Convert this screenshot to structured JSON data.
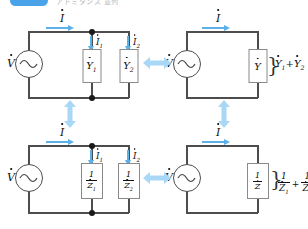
{
  "header": {
    "badge_color": "#4aa3e8",
    "faint_text": "アドミタンス 並列"
  },
  "colors": {
    "wire": "#4d4d4d",
    "arrow_blue": "#5bb0e8",
    "equiv_arrow": "#a8d8f5",
    "node": "#1a1a1a"
  },
  "panels": {
    "top_left": {
      "source_label": "V",
      "main_current_label": "I",
      "branch1_current_label": "I",
      "branch1_current_sub": "1",
      "branch2_current_label": "I",
      "branch2_current_sub": "2",
      "box1_label": "Y",
      "box1_sub": "1",
      "box2_label": "Y",
      "box2_sub": "2"
    },
    "top_right": {
      "source_label": "V",
      "main_current_label": "I",
      "box_label": "Y",
      "result_term1": "Y",
      "result_term1_sub": "1",
      "result_plus": "+",
      "result_term2": "Y",
      "result_term2_sub": "2"
    },
    "bottom_left": {
      "source_label": "V",
      "main_current_label": "I",
      "branch1_current_label": "I",
      "branch1_current_sub": "1",
      "branch2_current_label": "I",
      "branch2_current_sub": "2",
      "box1_numerator": "1",
      "box1_denominator": "Z",
      "box1_sub": "1",
      "box2_numerator": "1",
      "box2_denominator": "Z",
      "box2_sub": "2"
    },
    "bottom_right": {
      "source_label": "V",
      "main_current_label": "I",
      "box_numerator": "1",
      "box_denominator": "Z",
      "result_num1": "1",
      "result_den1": "Z",
      "result_den1_sub": "1",
      "result_plus": "+",
      "result_num2": "1",
      "result_den2": "Z",
      "result_den2_sub": "2"
    }
  },
  "equivalence_arrows": {
    "top_horizontal": "double-arrow-horizontal",
    "bottom_horizontal": "double-arrow-horizontal",
    "left_vertical": "double-arrow-vertical",
    "right_vertical": "double-arrow-vertical"
  }
}
